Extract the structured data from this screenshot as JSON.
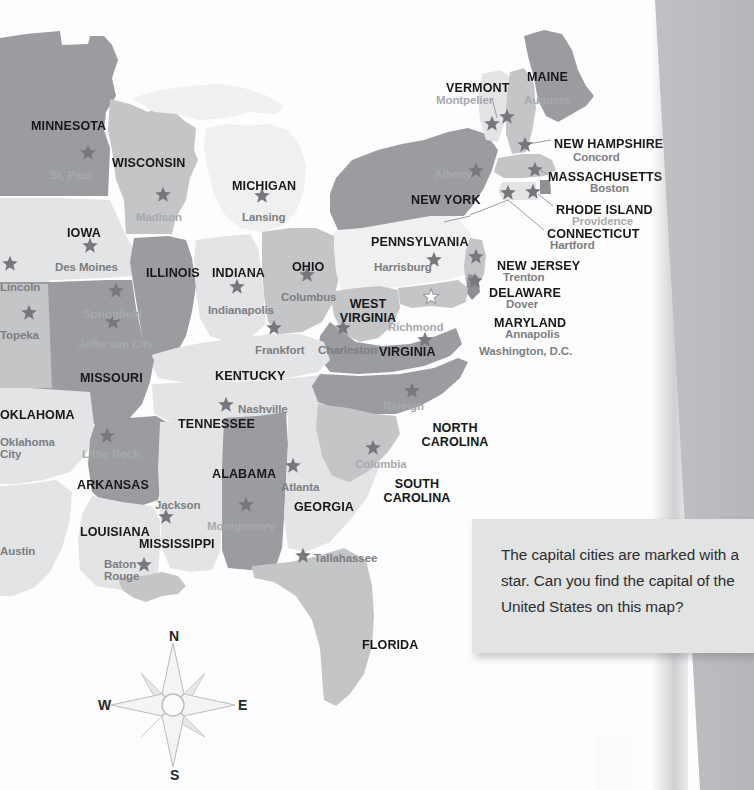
{
  "document": {
    "type": "printed-map-page",
    "title": "Eastern United States Capitals Map"
  },
  "callout": {
    "text": "The capital cities are marked with a star. Can you find the capital of the United States on this map?"
  },
  "compass": {
    "north": "N",
    "east": "E",
    "south": "S",
    "west": "W"
  },
  "colors": {
    "page": "#fdfdfd",
    "background": "#bcbdc0",
    "state_dark": "#9a9c9f",
    "state_mid": "#c3c5c7",
    "state_light": "#e3e4e5",
    "state_pale": "#eff0f0",
    "star": "#76787c",
    "star_capital_us": "#ffffff",
    "state_label": "#17181a",
    "city_label": "#8d8f93",
    "callout_bg": "#e2e3e3",
    "callout_text": "#2c2d2f"
  },
  "legend": {
    "star_meaning": "capital city",
    "white_star_meaning": "Washington, D.C. - capital of the United States"
  },
  "map": {
    "states": [
      {
        "name": "MINNESOTA",
        "x": 31,
        "y": 119,
        "align": "left",
        "shade": "dark"
      },
      {
        "name": "WISCONSIN",
        "x": 112,
        "y": 156,
        "align": "left",
        "shade": "mid"
      },
      {
        "name": "MICHIGAN",
        "x": 232,
        "y": 179,
        "align": "left",
        "shade": "pale"
      },
      {
        "name": "IOWA",
        "x": 67,
        "y": 226,
        "align": "left",
        "shade": "light"
      },
      {
        "name": "ILLINOIS",
        "x": 146,
        "y": 266,
        "align": "left",
        "shade": "dark"
      },
      {
        "name": "INDIANA",
        "x": 212,
        "y": 266,
        "align": "left",
        "shade": "light"
      },
      {
        "name": "OHIO",
        "x": 292,
        "y": 260,
        "align": "left",
        "shade": "mid"
      },
      {
        "name": "PENNSYLVANIA",
        "x": 371,
        "y": 235,
        "align": "left",
        "shade": "light"
      },
      {
        "name": "NEW YORK",
        "x": 411,
        "y": 193,
        "align": "left",
        "shade": "dark"
      },
      {
        "name": "VERMONT",
        "x": 446,
        "y": 81,
        "align": "left",
        "shade": "light"
      },
      {
        "name": "MAINE",
        "x": 527,
        "y": 70,
        "align": "left",
        "shade": "dark"
      },
      {
        "name": "NEW HAMPSHIRE",
        "x": 554,
        "y": 137,
        "align": "left",
        "shade": "mid"
      },
      {
        "name": "MASSACHUSETTS",
        "x": 548,
        "y": 170,
        "align": "left",
        "shade": "mid"
      },
      {
        "name": "RHODE ISLAND",
        "x": 556,
        "y": 203,
        "align": "left",
        "shade": "dark"
      },
      {
        "name": "CONNECTICUT",
        "x": 547,
        "y": 227,
        "align": "left",
        "shade": "light"
      },
      {
        "name": "NEW JERSEY",
        "x": 497,
        "y": 259,
        "align": "left",
        "shade": "mid"
      },
      {
        "name": "DELAWARE",
        "x": 489,
        "y": 286,
        "align": "left",
        "shade": "dark"
      },
      {
        "name": "MARYLAND",
        "x": 494,
        "y": 316,
        "align": "left",
        "shade": "mid"
      },
      {
        "name": "WEST\nVIRGINIA",
        "x": 368,
        "y": 297,
        "align": "center",
        "shade": "mid"
      },
      {
        "name": "VIRGINIA",
        "x": 379,
        "y": 345,
        "align": "left",
        "shade": "dark"
      },
      {
        "name": "KENTUCKY",
        "x": 215,
        "y": 369,
        "align": "left",
        "shade": "light"
      },
      {
        "name": "MISSOURI",
        "x": 80,
        "y": 371,
        "align": "left",
        "shade": "dark"
      },
      {
        "name": "OKLAHOMA",
        "x": 0,
        "y": 408,
        "align": "left",
        "shade": "light"
      },
      {
        "name": "TENNESSEE",
        "x": 178,
        "y": 417,
        "align": "left",
        "shade": "light"
      },
      {
        "name": "ARKANSAS",
        "x": 77,
        "y": 478,
        "align": "left",
        "shade": "dark"
      },
      {
        "name": "ALABAMA",
        "x": 212,
        "y": 467,
        "align": "left",
        "shade": "dark"
      },
      {
        "name": "GEORGIA",
        "x": 294,
        "y": 500,
        "align": "left",
        "shade": "light"
      },
      {
        "name": "NORTH\nCAROLINA",
        "x": 455,
        "y": 421,
        "align": "center",
        "shade": "dark"
      },
      {
        "name": "SOUTH\nCAROLINA",
        "x": 417,
        "y": 477,
        "align": "center",
        "shade": "mid"
      },
      {
        "name": "LOUISIANA",
        "x": 80,
        "y": 525,
        "align": "left",
        "shade": "light"
      },
      {
        "name": "MISSISSIPPI",
        "x": 139,
        "y": 537,
        "align": "left",
        "shade": "light"
      },
      {
        "name": "FLORIDA",
        "x": 362,
        "y": 638,
        "align": "left",
        "shade": "mid"
      }
    ],
    "cities": [
      {
        "name": "St. Paul",
        "x": 50,
        "y": 170,
        "star_x": 88,
        "star_y": 153,
        "tone": "light"
      },
      {
        "name": "Madison",
        "x": 136,
        "y": 212,
        "star_x": 163,
        "star_y": 195,
        "tone": "light"
      },
      {
        "name": "Lansing",
        "x": 242,
        "y": 212,
        "star_x": 262,
        "star_y": 196,
        "tone": "dark"
      },
      {
        "name": "Des Moines",
        "x": 55,
        "y": 262,
        "star_x": 90,
        "star_y": 246,
        "tone": "dark"
      },
      {
        "name": "Lincoln",
        "x": 0,
        "y": 282,
        "star_x": 10,
        "star_y": 264,
        "tone": "dark"
      },
      {
        "name": "Topeka",
        "x": 0,
        "y": 330,
        "star_x": 29,
        "star_y": 313,
        "tone": "dark"
      },
      {
        "name": "Springfield",
        "x": 83,
        "y": 309,
        "star_x": 116,
        "star_y": 291,
        "tone": "light"
      },
      {
        "name": "Indianapolis",
        "x": 208,
        "y": 305,
        "star_x": 237,
        "star_y": 287,
        "tone": "dark"
      },
      {
        "name": "Columbus",
        "x": 281,
        "y": 292,
        "star_x": 307,
        "star_y": 275,
        "tone": "dark"
      },
      {
        "name": "Jefferson City",
        "x": 78,
        "y": 339,
        "star_x": 113,
        "star_y": 322,
        "tone": "light"
      },
      {
        "name": "Frankfort",
        "x": 255,
        "y": 345,
        "star_x": 274,
        "star_y": 328,
        "tone": "dark"
      },
      {
        "name": "Charleston",
        "x": 318,
        "y": 345,
        "star_x": 343,
        "star_y": 328,
        "tone": "dark"
      },
      {
        "name": "Richmond",
        "x": 388,
        "y": 322,
        "star_x": 425,
        "star_y": 340,
        "tone": "light"
      },
      {
        "name": "Harrisburg",
        "x": 374,
        "y": 262,
        "star_x": 434,
        "star_y": 260,
        "tone": "dark"
      },
      {
        "name": "Albany",
        "x": 434,
        "y": 169,
        "star_x": 476,
        "star_y": 171,
        "tone": "light"
      },
      {
        "name": "Montpelier",
        "x": 436,
        "y": 95,
        "star_x": 492,
        "star_y": 124,
        "tone": "light"
      },
      {
        "name": "Augusta",
        "x": 524,
        "y": 95,
        "star_x": 507,
        "star_y": 117,
        "tone": "light"
      },
      {
        "name": "Concord",
        "x": 573,
        "y": 152,
        "star_x": 525,
        "star_y": 145,
        "tone": "dark"
      },
      {
        "name": "Boston",
        "x": 590,
        "y": 183,
        "star_x": 535,
        "star_y": 170,
        "tone": "dark"
      },
      {
        "name": "Providence",
        "x": 572,
        "y": 216,
        "star_x": 533,
        "star_y": 192,
        "tone": "light"
      },
      {
        "name": "Hartford",
        "x": 550,
        "y": 240,
        "star_x": 508,
        "star_y": 193,
        "tone": "dark"
      },
      {
        "name": "Trenton",
        "x": 503,
        "y": 272,
        "star_x": 476,
        "star_y": 257,
        "tone": "dark"
      },
      {
        "name": "Dover",
        "x": 506,
        "y": 299,
        "star_x": 475,
        "star_y": 281,
        "tone": "dark"
      },
      {
        "name": "Annapolis",
        "x": 505,
        "y": 329,
        "star_x": 0,
        "star_y": 0,
        "tone": "dark"
      },
      {
        "name": "Washington, D.C.",
        "x": 479,
        "y": 346,
        "star_x": 431,
        "star_y": 297,
        "tone": "dark",
        "white_star": true
      },
      {
        "name": "Nashville",
        "x": 238,
        "y": 404,
        "star_x": 226,
        "star_y": 405,
        "tone": "dark"
      },
      {
        "name": "Raleigh",
        "x": 383,
        "y": 401,
        "star_x": 412,
        "star_y": 391,
        "tone": "light"
      },
      {
        "name": "Columbia",
        "x": 355,
        "y": 459,
        "star_x": 373,
        "star_y": 448,
        "tone": "light"
      },
      {
        "name": "Atlanta",
        "x": 281,
        "y": 482,
        "star_x": 293,
        "star_y": 466,
        "tone": "dark"
      },
      {
        "name": "Little Rock",
        "x": 82,
        "y": 449,
        "star_x": 107,
        "star_y": 436,
        "tone": "light"
      },
      {
        "name": "Oklahoma\nCity",
        "x": 0,
        "y": 437,
        "star_x": 0,
        "star_y": 0,
        "tone": "dark"
      },
      {
        "name": "Jackson",
        "x": 155,
        "y": 500,
        "star_x": 166,
        "star_y": 517,
        "tone": "dark"
      },
      {
        "name": "Montgomery",
        "x": 207,
        "y": 521,
        "star_x": 246,
        "star_y": 505,
        "tone": "light"
      },
      {
        "name": "Baton\nRouge",
        "x": 104,
        "y": 559,
        "star_x": 144,
        "star_y": 565,
        "tone": "dark"
      },
      {
        "name": "Tallahassee",
        "x": 314,
        "y": 553,
        "star_x": 303,
        "star_y": 556,
        "tone": "dark"
      },
      {
        "name": "Austin",
        "x": 0,
        "y": 546,
        "star_x": 0,
        "star_y": 0,
        "tone": "dark"
      }
    ]
  }
}
